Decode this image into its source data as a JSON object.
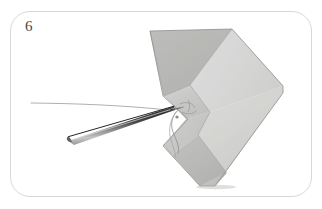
{
  "figure": {
    "step_number": "6",
    "frame": {
      "border_color": "#d8d8d8",
      "background_color": "#ffffff",
      "corner_radius_px": 20
    },
    "objects": [
      {
        "name": "folded-paper",
        "label": "Folded paper chevron",
        "colors": {
          "light_facet": "#e4e4e2",
          "mid_facet": "#cfcfcc",
          "dark_facet": "#b4b4b1",
          "shadow_facet": "#a3a3a0",
          "edge_line": "#8d8d8a"
        }
      },
      {
        "name": "sewing-needle",
        "label": "Sewing needle",
        "colors": {
          "body_dark": "#3a3a3a",
          "body_mid": "#6f6f6f",
          "body_light": "#b9b9b9",
          "highlight": "#e6e6e6"
        }
      },
      {
        "name": "thread",
        "label": "Thread",
        "colors": {
          "stroke": "#8a8a88"
        }
      },
      {
        "name": "pierce-point",
        "label": "Needle entry point in paper",
        "colors": {
          "stroke": "#9a9a96"
        }
      }
    ],
    "palette": {
      "page_background": "#ffffff",
      "frame_border": "#d8d8d8",
      "number_text": "#4a4a4a"
    }
  }
}
